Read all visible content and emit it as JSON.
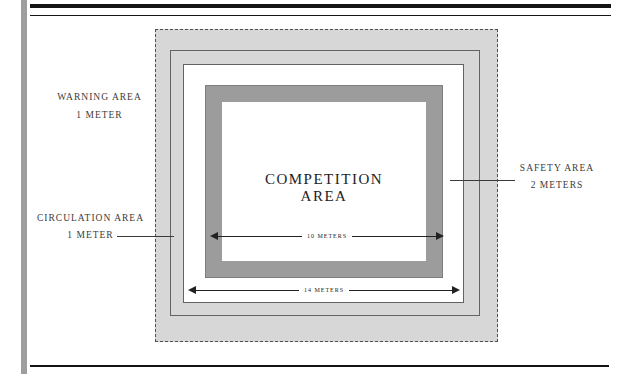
{
  "colors": {
    "area-gray": "#d7d7d7",
    "mat-gray": "#9c9c9c",
    "mat-edge": "#7e7e7e",
    "line-gray": "#636363",
    "dot-border": "#4f4f4f",
    "margin-bar": "#9e9e9e",
    "rule": "#151515",
    "text": "#3b3b3b",
    "text-dark": "#222222"
  },
  "diagram": {
    "labels": {
      "warning": {
        "line1": "WARNING AREA",
        "line2": "1 METER"
      },
      "circulation": {
        "line1": "CIRCULATION AREA",
        "line2": "1 METER"
      },
      "safety": {
        "line1": "SAFETY AREA",
        "line2": "2 METERS"
      },
      "competition": {
        "line1": "COMPETITION",
        "line2": "AREA"
      }
    },
    "dimensions": {
      "inner": {
        "label": "10 METERS"
      },
      "outer": {
        "label": "14 METERS"
      }
    }
  }
}
